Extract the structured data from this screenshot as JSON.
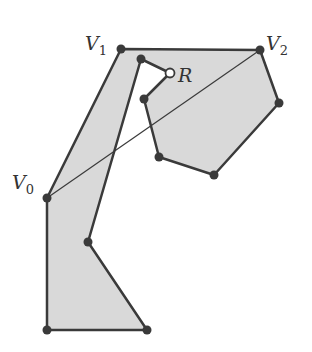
{
  "diagram": {
    "polygon": {
      "fill": "#d9d9d9",
      "stroke": "#3a3a3a",
      "points": [
        [
          47,
          198
        ],
        [
          121,
          49
        ],
        [
          260,
          50
        ],
        [
          279,
          103
        ],
        [
          214,
          175
        ],
        [
          159,
          157
        ],
        [
          144,
          99
        ],
        [
          170,
          73
        ],
        [
          141,
          59
        ],
        [
          88,
          242
        ],
        [
          147,
          330
        ],
        [
          47,
          330
        ]
      ]
    },
    "chord": {
      "from": [
        47,
        198
      ],
      "to": [
        260,
        50
      ],
      "stroke": "#3a3a3a"
    },
    "vertices": [
      {
        "x": 47,
        "y": 198,
        "type": "filled"
      },
      {
        "x": 121,
        "y": 49,
        "type": "filled"
      },
      {
        "x": 260,
        "y": 50,
        "type": "filled"
      },
      {
        "x": 279,
        "y": 103,
        "type": "filled"
      },
      {
        "x": 214,
        "y": 175,
        "type": "filled"
      },
      {
        "x": 159,
        "y": 157,
        "type": "filled"
      },
      {
        "x": 144,
        "y": 99,
        "type": "filled"
      },
      {
        "x": 170,
        "y": 73,
        "type": "open"
      },
      {
        "x": 141,
        "y": 59,
        "type": "filled"
      },
      {
        "x": 88,
        "y": 242,
        "type": "filled"
      },
      {
        "x": 147,
        "y": 330,
        "type": "filled"
      },
      {
        "x": 47,
        "y": 330,
        "type": "filled"
      }
    ],
    "labels": {
      "v0": {
        "main": "V",
        "sub": "0"
      },
      "v1": {
        "main": "V",
        "sub": "1"
      },
      "v2": {
        "main": "V",
        "sub": "2"
      },
      "r": {
        "main": "R"
      }
    }
  }
}
